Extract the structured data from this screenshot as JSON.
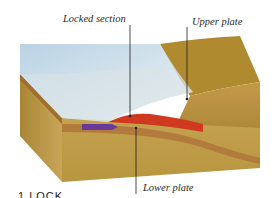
{
  "diagram": {
    "title_partial": "1 LOCK",
    "labels": {
      "locked_section": "Locked section",
      "upper_plate": "Upper plate",
      "lower_plate": "Lower plate"
    },
    "colors": {
      "upper_plate_top": "#b08a2e",
      "block_side": "#c9a24a",
      "block_front": "#b8913f",
      "lower_plate_band": "#b27a3c",
      "locked_zone": "#d0381f",
      "motion_arrow": "#6a3a9a",
      "water": "#bcd4e4"
    }
  }
}
